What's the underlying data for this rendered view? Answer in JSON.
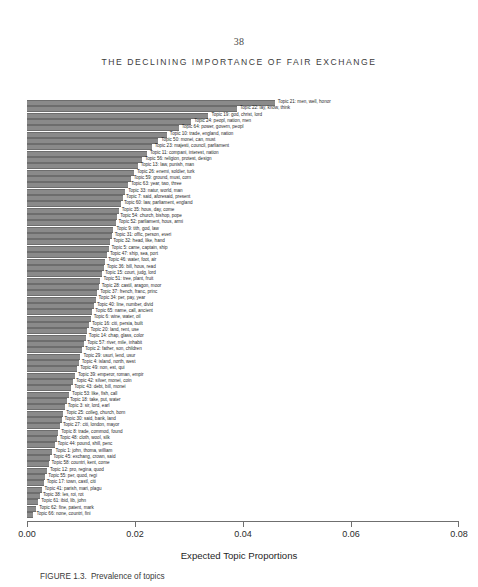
{
  "page": {
    "number": "38",
    "running_head": "THE DECLINING IMPORTANCE OF FAIR EXCHANGE"
  },
  "figure": {
    "caption_number": "FIGURE 1.3.",
    "caption_text": "Prevalence of topics"
  },
  "chart_data": {
    "type": "bar",
    "orientation": "horizontal",
    "title": "",
    "xlabel": "Expected Topic Proportions",
    "ylabel": "",
    "xlim": [
      0.0,
      0.08
    ],
    "xticks": [
      "0.00",
      "0.02",
      "0.04",
      "0.06",
      "0.08"
    ],
    "xtick_values": [
      0.0,
      0.02,
      0.04,
      0.06,
      0.08
    ],
    "grid": false,
    "legend": false,
    "bar_color": "#8a8a8a",
    "categories": [
      "Topic 21: men, well, honor",
      "Topic 22: lay, know, think",
      "Topic 19: god, christ, lord",
      "Topic 24: peopl, nation, men",
      "Topic 64: power, govern, peopl",
      "Topic 10: trade, england, nation",
      "Topic 50: monei, can, must",
      "Topic 23: majesti, council, parliament",
      "Topic 11: compani, interest, nation",
      "Topic 56: religion, protest, design",
      "Topic 13: law, punish, man",
      "Topic 26: enemi, soldier, turk",
      "Topic 59: ground, must, corn",
      "Topic 63: year, two, three",
      "Topic 33: natur, world, man",
      "Topic 7: said, aforesaid, present",
      "Topic 60: law, parliament, england",
      "Topic 35: hous, day, come",
      "Topic 54: church, bishop, pope",
      "Topic 52: parliament, hous, armi",
      "Topic 9: tith, god, law",
      "Topic 31: offic, person, everi",
      "Topic 32: head, like, hand",
      "Topic 5: came, captain, ship",
      "Topic 47: ship, sea, port",
      "Topic 46: water, foot, air",
      "Topic 36: bill, hous, read",
      "Topic 15: court, judg, lord",
      "Topic 51: tree, plant, fruit",
      "Topic 28: castil, aragon, moor",
      "Topic 37: french, franc, princ",
      "Topic 34: per, pay, year",
      "Topic 40: line, number, divid",
      "Topic 65: name, call, ancient",
      "Topic 6: wine, water, oil",
      "Topic 16: citi, persia, built",
      "Topic 20: land, rent, use",
      "Topic 14: chap, glass, color",
      "Topic 57: river, mile, inhabit",
      "Topic 2: father, son, children",
      "Topic 29: usuri, lend, usur",
      "Topic 4: island, north, west",
      "Topic 49: non, est, qui",
      "Topic 39: emperor, roman, empir",
      "Topic 42: silver, monei, coin",
      "Topic 43: debt, bill, monei",
      "Topic 53: like, fish, call",
      "Topic 18: take, put, water",
      "Topic 3: sir, lord, earl",
      "Topic 25: colleg, church, born",
      "Topic 30: said, bank, land",
      "Topic 27: citi, london, mayor",
      "Topic 8: trade, commod, found",
      "Topic 48: cloth, wool, silk",
      "Topic 44: pound, shill, penc",
      "Topic 1: john, thoma, william",
      "Topic 45: exchang, crown, said",
      "Topic 58: countri, kent, come",
      "Topic 12: pro, regina, quod",
      "Topic 55: per, quod, regi",
      "Topic 17: town, castl, citi",
      "Topic 41: parish, mari, plagu",
      "Topic 38: les, roi, rot",
      "Topic 61: ibid, lib, john",
      "Topic 62: fine, patent, mark",
      "Topic 66: none, countri, fini"
    ],
    "values": [
      0.0459,
      0.0389,
      0.0336,
      0.0304,
      0.0281,
      0.0259,
      0.0243,
      0.0231,
      0.0222,
      0.0213,
      0.0205,
      0.0198,
      0.0192,
      0.0187,
      0.0182,
      0.0178,
      0.0174,
      0.017,
      0.0167,
      0.0164,
      0.016,
      0.0157,
      0.0154,
      0.0151,
      0.0148,
      0.0145,
      0.0142,
      0.0139,
      0.0136,
      0.0133,
      0.013,
      0.0127,
      0.0124,
      0.0121,
      0.0118,
      0.0115,
      0.0112,
      0.0109,
      0.0106,
      0.0102,
      0.0099,
      0.0096,
      0.0093,
      0.0089,
      0.0085,
      0.0082,
      0.0078,
      0.0074,
      0.007,
      0.0067,
      0.0064,
      0.0061,
      0.0058,
      0.0055,
      0.0051,
      0.0047,
      0.0043,
      0.004,
      0.0037,
      0.0034,
      0.0031,
      0.0027,
      0.0024,
      0.0021,
      0.0017,
      0.0012
    ]
  }
}
